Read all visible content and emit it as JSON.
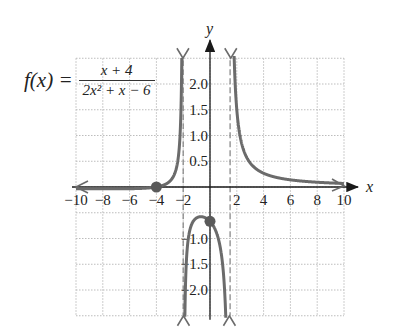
{
  "chart_data": {
    "type": "line",
    "title": "",
    "function_label": "f(x) =",
    "function_numerator": "x + 4",
    "function_denominator": "2x² + x − 6",
    "xlabel": "x",
    "ylabel": "y",
    "xlim": [
      -10,
      10
    ],
    "ylim": [
      -2.5,
      2.5
    ],
    "grid": true,
    "grid_style": "dotted",
    "x_ticks": [
      -10,
      -8,
      -6,
      -4,
      -2,
      2,
      4,
      6,
      8,
      10
    ],
    "x_tick_labels": [
      "−10",
      "−8",
      "−6",
      "−4",
      "−2",
      "2",
      "4",
      "6",
      "8",
      "10"
    ],
    "y_ticks": [
      2.0,
      1.5,
      1.0,
      0.5,
      -1.0,
      -1.5,
      -2.0
    ],
    "y_tick_labels": [
      "2.0",
      "1.5",
      "1.0",
      "0.5",
      "−1.0",
      "−1.5",
      "−2.0"
    ],
    "vertical_asymptotes": [
      -2,
      1.5
    ],
    "horizontal_asymptote": 0,
    "points": [
      {
        "x": -4,
        "y": 0,
        "label": "x-intercept"
      },
      {
        "x": 0,
        "y": -0.667,
        "label": "y-intercept"
      }
    ],
    "series": [
      {
        "name": "f(x) = (x+4)/(2x²+x−6)",
        "branch": "left",
        "x_range": [
          -10,
          -2
        ]
      },
      {
        "name": "f(x) = (x+4)/(2x²+x−6)",
        "branch": "middle",
        "x_range": [
          -2,
          1.5
        ]
      },
      {
        "name": "f(x) = (x+4)/(2x²+x−6)",
        "branch": "right",
        "x_range": [
          1.5,
          10
        ]
      }
    ],
    "colors": {
      "curve": "#6b6b6b",
      "axis": "#1a1a1a",
      "grid": "#bdbdbd",
      "asymptote": "#8a8a8a",
      "point": "#5a5a5a"
    }
  }
}
